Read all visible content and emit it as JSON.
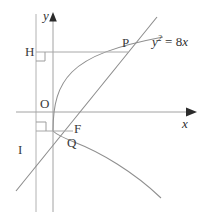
{
  "figure": {
    "kind": "geometry-diagram",
    "width": 212,
    "height": 220,
    "background_color": "#ffffff",
    "stroke_color": "#9a9a9a",
    "text_color": "#2f2f2f"
  },
  "equation": {
    "lhs_var": "y",
    "exponent": "2",
    "relation": "=",
    "coefficient": "8",
    "rhs_var": "x",
    "full_text": "y2 = 8x"
  },
  "axes": {
    "x_label": "x",
    "y_label": "y",
    "x_axis_y_px": 112,
    "y_axis_x_px": 53,
    "x_arrow_tip_px": 196,
    "y_arrow_tip_px": 13
  },
  "directrix": {
    "name": "directrix",
    "x_px": 36
  },
  "points": [
    {
      "id": "H",
      "label": "H",
      "x_px": 36,
      "y_px": 52,
      "note": "foot of perpendicular from P to directrix"
    },
    {
      "id": "P",
      "label": "P",
      "x_px": 128,
      "y_px": 52,
      "note": "upper intersection of focal chord with parabola"
    },
    {
      "id": "O",
      "label": "O",
      "x_px": 53,
      "y_px": 112,
      "note": "origin / vertex"
    },
    {
      "id": "F",
      "label": "F",
      "x_px": 70,
      "y_px": 130,
      "note": "focus"
    },
    {
      "id": "Q",
      "label": "Q",
      "x_px": 73,
      "y_px": 134,
      "note": "lower intersection of focal chord with parabola"
    },
    {
      "id": "I",
      "label": "I",
      "x_px": 36,
      "y_px": 134,
      "note": "foot of perpendicular from Q to directrix"
    }
  ],
  "segments": [
    {
      "id": "HP",
      "from": "H",
      "to": "P",
      "style": "solid"
    },
    {
      "id": "IQ",
      "from": "I",
      "to": "Q",
      "style": "solid"
    },
    {
      "id": "PQ",
      "from": "P",
      "to": "Q",
      "style": "solid",
      "note": "focal chord through F"
    }
  ],
  "right_angles": [
    {
      "at": "H",
      "between": [
        "directrix",
        "HP"
      ]
    },
    {
      "at": "I",
      "between": [
        "directrix",
        "IQ"
      ]
    }
  ],
  "curve": {
    "name": "parabola",
    "equation": "y2 = 8x",
    "opens": "right",
    "vertex_px": [
      53,
      112
    ]
  }
}
